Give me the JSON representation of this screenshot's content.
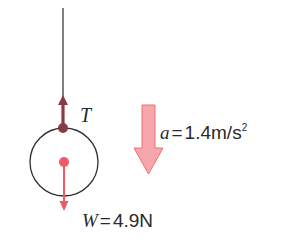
{
  "diagram": {
    "colors": {
      "string": "#3a3a3a",
      "ball_outline": "#2e2e2e",
      "tension_arrow": "#8a3a45",
      "weight_arrow": "#ef5a65",
      "accel_arrow_fill": "#f7a7ab",
      "accel_arrow_stroke": "#ee6f76",
      "text": "#2a2a2a"
    },
    "tension": {
      "symbol": "T"
    },
    "acceleration": {
      "symbol": "a",
      "equals": "=",
      "value": "1.4m/s",
      "exponent": "2"
    },
    "weight": {
      "symbol": "W",
      "equals": "=",
      "value": "4.9N"
    }
  }
}
